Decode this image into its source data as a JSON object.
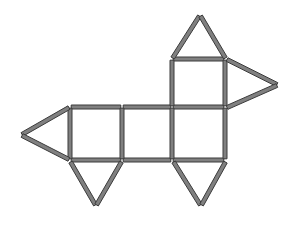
{
  "canvas": {
    "width": 294,
    "height": 225,
    "background_color": "#ffffff"
  },
  "figure": {
    "name": "matchstick-dog-puzzle",
    "stick_fill_color": "#808080",
    "stick_outline_color": "#3a3a3a",
    "stick_thickness": 4,
    "stick_count": 20
  },
  "parts": {
    "body_squares_label": "body-squares",
    "head_square_label": "head-square",
    "ear_triangle_label": "ear-triangle",
    "nose_triangle_label": "nose-triangle",
    "snout_triangle_label": "snout-triangle",
    "legs_label": "legs"
  },
  "geometry": {
    "sticks": [
      {
        "name": "body-top-left",
        "x1": 70,
        "y1": 107,
        "x2": 122,
        "y2": 107
      },
      {
        "name": "body-top-middle",
        "x1": 122,
        "y1": 107,
        "x2": 172,
        "y2": 107
      },
      {
        "name": "body-top-right",
        "x1": 172,
        "y1": 107,
        "x2": 225,
        "y2": 107
      },
      {
        "name": "body-bottom-left",
        "x1": 70,
        "y1": 160,
        "x2": 122,
        "y2": 160
      },
      {
        "name": "body-bottom-middle",
        "x1": 122,
        "y1": 160,
        "x2": 172,
        "y2": 160
      },
      {
        "name": "body-bottom-right",
        "x1": 172,
        "y1": 160,
        "x2": 225,
        "y2": 160
      },
      {
        "name": "body-vertical-1",
        "x1": 70,
        "y1": 107,
        "x2": 70,
        "y2": 160
      },
      {
        "name": "body-vertical-2",
        "x1": 122,
        "y1": 107,
        "x2": 122,
        "y2": 160
      },
      {
        "name": "body-vertical-3",
        "x1": 172,
        "y1": 107,
        "x2": 172,
        "y2": 160
      },
      {
        "name": "body-vertical-4",
        "x1": 225,
        "y1": 107,
        "x2": 225,
        "y2": 160
      },
      {
        "name": "head-square-top",
        "x1": 172,
        "y1": 59,
        "x2": 225,
        "y2": 59
      },
      {
        "name": "head-square-left",
        "x1": 172,
        "y1": 59,
        "x2": 172,
        "y2": 107
      },
      {
        "name": "head-square-right",
        "x1": 225,
        "y1": 59,
        "x2": 225,
        "y2": 107
      },
      {
        "name": "ear-triangle-left",
        "x1": 172,
        "y1": 59,
        "x2": 200,
        "y2": 15
      },
      {
        "name": "ear-triangle-right",
        "x1": 200,
        "y1": 15,
        "x2": 226,
        "y2": 59
      },
      {
        "name": "snout-triangle-upper",
        "x1": 226,
        "y1": 59,
        "x2": 278,
        "y2": 85
      },
      {
        "name": "snout-triangle-lower",
        "x1": 278,
        "y1": 85,
        "x2": 226,
        "y2": 108
      },
      {
        "name": "nose-triangle-upper",
        "x1": 70,
        "y1": 107,
        "x2": 21,
        "y2": 135
      },
      {
        "name": "nose-triangle-lower",
        "x1": 21,
        "y1": 135,
        "x2": 70,
        "y2": 160
      },
      {
        "name": "front-leg-left",
        "x1": 70,
        "y1": 161,
        "x2": 96,
        "y2": 206
      },
      {
        "name": "front-leg-right",
        "x1": 96,
        "y1": 206,
        "x2": 122,
        "y2": 161
      },
      {
        "name": "hind-leg-left",
        "x1": 173,
        "y1": 161,
        "x2": 201,
        "y2": 206
      },
      {
        "name": "hind-leg-right",
        "x1": 201,
        "y1": 206,
        "x2": 226,
        "y2": 161
      }
    ]
  }
}
